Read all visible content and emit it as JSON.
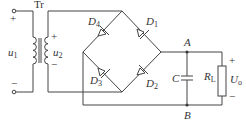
{
  "diagram": {
    "type": "bridge rectifier with capacitor filter",
    "transformer": {
      "label": "Tr",
      "primary": {
        "symbol": "u",
        "sub": "1",
        "plus": "+",
        "minus": "−"
      },
      "secondary": {
        "symbol": "u",
        "sub": "2",
        "plus": "+",
        "minus": "−"
      }
    },
    "diodes": [
      {
        "symbol": "D",
        "sub": "1"
      },
      {
        "symbol": "D",
        "sub": "2"
      },
      {
        "symbol": "D",
        "sub": "3"
      },
      {
        "symbol": "D",
        "sub": "4"
      }
    ],
    "nodes": {
      "a": "A",
      "b": "B"
    },
    "capacitor": {
      "label": "C"
    },
    "resistor": {
      "symbol": "R",
      "sub": "L"
    },
    "output": {
      "symbol": "U",
      "sub": "o",
      "plus": "+",
      "minus": "−"
    },
    "colors": {
      "line": "#444444",
      "background": "#ffffff"
    }
  }
}
